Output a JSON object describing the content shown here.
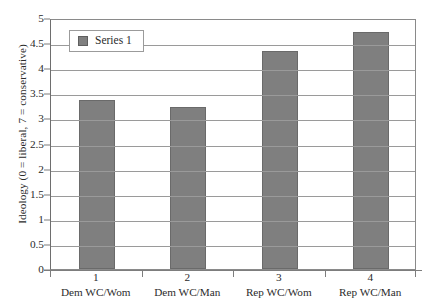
{
  "chart_data": {
    "type": "bar",
    "title": "",
    "subtitle": "",
    "xlabel": "",
    "ylabel": "Ideology (0 = liberal, 7 = conservative)",
    "categories": [
      "Dem WC/Wom",
      "Dem WC/Man",
      "Rep WC/Wom",
      "Rep WC/Man"
    ],
    "category_numbers": [
      "1",
      "2",
      "3",
      "4"
    ],
    "values": [
      3.37,
      3.22,
      4.34,
      4.72
    ],
    "series": [
      {
        "name": "Series 1",
        "values": [
          3.37,
          3.22,
          4.34,
          4.72
        ],
        "color": "#7f7f7f"
      }
    ],
    "ylim": [
      0,
      5
    ],
    "ytick_values": [
      0,
      0.5,
      1,
      1.5,
      2,
      2.5,
      3,
      3.5,
      4,
      4.5,
      5
    ],
    "ytick_labels": [
      "0",
      "0.5",
      "1",
      "1.5",
      "2",
      "2.5",
      "3",
      "3.5",
      "4",
      "4.5",
      "5"
    ],
    "grid": "horizontal",
    "legend_position": "top-left-inside",
    "legend_entries": [
      "Series 1"
    ],
    "bar_color": "#7f7f7f",
    "bar_border_color": "#6a6a6a",
    "gridline_color": "#9a9a9a",
    "plot_border_color": "#8a8a8a",
    "background_color": "#ffffff"
  }
}
